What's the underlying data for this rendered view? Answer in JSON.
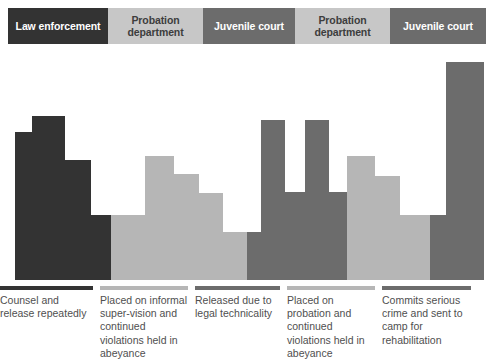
{
  "header": {
    "agencies": [
      {
        "label": "Law enforcement",
        "tone": "tone-dark",
        "width_px": 100
      },
      {
        "label": "Probation department",
        "tone": "tone-light",
        "width_px": 95
      },
      {
        "label": "Juvenile court",
        "tone": "tone-mid",
        "width_px": 92
      },
      {
        "label": "Probation department",
        "tone": "tone-light",
        "width_px": 95
      },
      {
        "label": "Juvenile court",
        "tone": "tone-mid",
        "width_px": 96
      }
    ]
  },
  "captions": [
    {
      "text": "Counsel and release repeatedly",
      "tone": "tone-dark",
      "width_px": 100
    },
    {
      "text": "Placed on informal super-vision and continued violations held in abeyance",
      "tone": "tone-light",
      "width_px": 95
    },
    {
      "text": "Released due to legal technicality",
      "tone": "tone-mid",
      "width_px": 92
    },
    {
      "text": "Placed on probation and continued violations held in abeyance",
      "tone": "tone-light",
      "width_px": 95
    },
    {
      "text": "Commits serious crime and sent to camp for rehabilitation",
      "tone": "tone-mid",
      "width_px": 96
    }
  ],
  "colors": {
    "dark": "#333333",
    "light": "#b6b6b6",
    "mid": "#6c6c6c",
    "header_light": "#c7c7c7",
    "background": "#ffffff",
    "text": "#4f4f4f"
  },
  "chart_data": {
    "type": "bar",
    "title": "",
    "xlabel": "",
    "ylabel": "",
    "grid": false,
    "legend": "none",
    "note": "Stepped bar profile; each block is a contiguous step segment. x/width in px from left edge of 494px canvas, height in px measured up from the chart baseline (y=280).",
    "categories": [
      "Law enforcement",
      "Probation department",
      "Juvenile court",
      "Probation department",
      "Juvenile court"
    ],
    "blocks": [
      {
        "group": 0,
        "tone": "tone-dark",
        "x": 15,
        "width": 17,
        "height": 148
      },
      {
        "group": 0,
        "tone": "tone-dark",
        "x": 32,
        "width": 33,
        "height": 164
      },
      {
        "group": 0,
        "tone": "tone-dark",
        "x": 65,
        "width": 26,
        "height": 120
      },
      {
        "group": 0,
        "tone": "tone-dark",
        "x": 91,
        "width": 20,
        "height": 65
      },
      {
        "group": 1,
        "tone": "tone-light",
        "x": 111,
        "width": 34,
        "height": 65
      },
      {
        "group": 1,
        "tone": "tone-light",
        "x": 145,
        "width": 29,
        "height": 124
      },
      {
        "group": 1,
        "tone": "tone-light",
        "x": 174,
        "width": 25,
        "height": 106
      },
      {
        "group": 1,
        "tone": "tone-light",
        "x": 199,
        "width": 24,
        "height": 87
      },
      {
        "group": 1,
        "tone": "tone-light",
        "x": 223,
        "width": 24,
        "height": 48
      },
      {
        "group": 2,
        "tone": "tone-mid",
        "x": 247,
        "width": 14,
        "height": 48
      },
      {
        "group": 2,
        "tone": "tone-mid",
        "x": 261,
        "width": 24,
        "height": 160
      },
      {
        "group": 2,
        "tone": "tone-mid",
        "x": 285,
        "width": 20,
        "height": 88
      },
      {
        "group": 2,
        "tone": "tone-mid",
        "x": 305,
        "width": 24,
        "height": 160
      },
      {
        "group": 2,
        "tone": "tone-mid",
        "x": 329,
        "width": 18,
        "height": 88
      },
      {
        "group": 3,
        "tone": "tone-light",
        "x": 347,
        "width": 28,
        "height": 124
      },
      {
        "group": 3,
        "tone": "tone-light",
        "x": 375,
        "width": 25,
        "height": 104
      },
      {
        "group": 3,
        "tone": "tone-light",
        "x": 400,
        "width": 30,
        "height": 65
      },
      {
        "group": 4,
        "tone": "tone-mid",
        "x": 430,
        "width": 16,
        "height": 65
      },
      {
        "group": 4,
        "tone": "tone-mid",
        "x": 446,
        "width": 38,
        "height": 218
      }
    ],
    "axis": {
      "baseline_y": 280,
      "x_range_px": [
        0,
        494
      ]
    }
  }
}
